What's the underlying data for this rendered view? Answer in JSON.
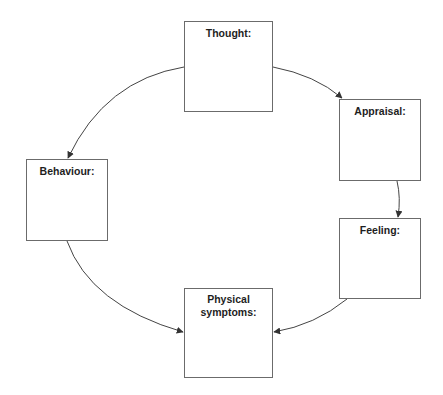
{
  "diagram": {
    "type": "cycle",
    "colors": {
      "stroke": "#6b6b6b",
      "arrow": "#333333",
      "text": "#1e1e1e",
      "background": "#ffffff"
    },
    "nodes": [
      {
        "id": "thought",
        "label": "Thought:"
      },
      {
        "id": "appraisal",
        "label": "Appraisal:"
      },
      {
        "id": "feeling",
        "label": "Feeling:"
      },
      {
        "id": "physical",
        "label": "Physical symptoms:"
      },
      {
        "id": "behaviour",
        "label": "Behaviour:"
      }
    ],
    "edges": [
      {
        "from": "thought",
        "to": "appraisal"
      },
      {
        "from": "appraisal",
        "to": "feeling"
      },
      {
        "from": "feeling",
        "to": "physical"
      },
      {
        "from": "behaviour",
        "to": "physical"
      },
      {
        "from": "thought",
        "to": "behaviour"
      }
    ]
  }
}
